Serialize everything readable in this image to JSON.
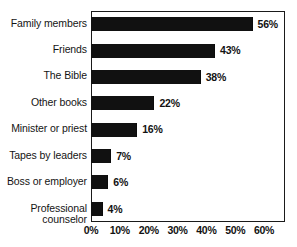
{
  "chart_data": {
    "type": "bar",
    "orientation": "horizontal",
    "title": "",
    "subtitle": "",
    "xlabel": "",
    "ylabel": "",
    "xlim": [
      0,
      65
    ],
    "grid": false,
    "legend": false,
    "value_suffix": "%",
    "categories": [
      "Family members",
      "Friends",
      "The Bible",
      "Other books",
      "Minister or priest",
      "Tapes by leaders",
      "Boss or employer",
      "Professional\ncounselor"
    ],
    "values": [
      56,
      43,
      38,
      22,
      16,
      7,
      6,
      4
    ],
    "data_labels": [
      "56%",
      "43%",
      "38%",
      "22%",
      "16%",
      "7%",
      "6%",
      "4%"
    ],
    "xticks": [
      0,
      10,
      20,
      30,
      40,
      50,
      60
    ],
    "xtick_labels": [
      "0%",
      "10%",
      "20%",
      "30%",
      "40%",
      "50%",
      "60%"
    ],
    "bar_color": "#111111",
    "axis_color": "#1a1a1a",
    "background_color": "#ffffff"
  }
}
